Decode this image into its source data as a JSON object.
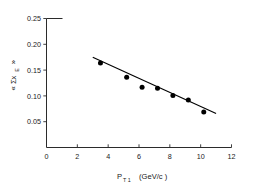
{
  "chart_data": {
    "type": "scatter",
    "title": "",
    "subtitle": "",
    "xlabel": "P_T1  (GeV/c)",
    "xlabel_main": "P",
    "xlabel_sub": "T 1",
    "xlabel_unit": "(GeV/c )",
    "ylabel": "<Σx_E>",
    "ylabel_open": "« Σx",
    "ylabel_sub": "E",
    "ylabel_close": "»",
    "xlim": [
      0,
      12
    ],
    "ylim": [
      0,
      0.25
    ],
    "xticks": [
      0,
      2,
      4,
      6,
      8,
      10,
      12
    ],
    "xtick_labels": [
      "0",
      "2",
      "4",
      "6",
      "8",
      "10",
      "12"
    ],
    "yticks": [
      0.05,
      0.1,
      0.15,
      0.2,
      0.25
    ],
    "ytick_labels": [
      "0.05",
      "0.10",
      "0.15",
      "0.20",
      "0.25"
    ],
    "grid": false,
    "legend": false,
    "marker_style": "filled-circle",
    "marker_color": "#000000",
    "line_color": "#000000",
    "axis_color": "#2b2b2b",
    "background": "#ffffff",
    "series": [
      {
        "name": "data",
        "type": "scatter",
        "x": [
          3.5,
          5.2,
          6.2,
          7.2,
          8.2,
          9.2,
          10.2
        ],
        "y": [
          0.164,
          0.136,
          0.117,
          0.115,
          0.101,
          0.092,
          0.069
        ]
      },
      {
        "name": "linear fit",
        "type": "line",
        "x": [
          3.0,
          11.0
        ],
        "y": [
          0.175,
          0.066
        ]
      }
    ]
  }
}
